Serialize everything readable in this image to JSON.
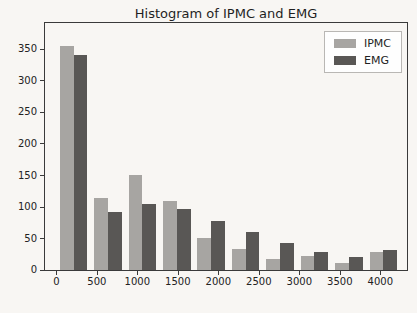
{
  "figure": {
    "title": "Histogram of IPMC and EMG"
  },
  "chart_data": {
    "type": "bar",
    "subtype": "histogram",
    "title": "Histogram of IPMC and EMG",
    "bin_edges": [
      0,
      425,
      850,
      1275,
      1700,
      2125,
      2550,
      2975,
      3400,
      3825,
      4250
    ],
    "series": [
      {
        "name": "IPMC",
        "color": "#a7a5a2",
        "values": [
          356,
          114,
          151,
          110,
          51,
          33,
          18,
          22,
          11,
          28
        ]
      },
      {
        "name": "EMG",
        "color": "#595755",
        "values": [
          342,
          92,
          105,
          97,
          77,
          61,
          43,
          28,
          21,
          32
        ]
      }
    ],
    "x_ticks": [
      0,
      500,
      1000,
      1500,
      2000,
      2500,
      3000,
      3500,
      4000
    ],
    "y_ticks": [
      0,
      50,
      100,
      150,
      200,
      250,
      300,
      350
    ],
    "xlim": [
      -140,
      4330
    ],
    "ylim": [
      0,
      392
    ],
    "grid": false,
    "legend_position": "upper right",
    "axis_color": "#3a3a3a",
    "text_color": "#222222",
    "bar_fill_fraction": 0.8
  },
  "legend": {
    "items": [
      {
        "label": "IPMC"
      },
      {
        "label": "EMG"
      }
    ]
  }
}
